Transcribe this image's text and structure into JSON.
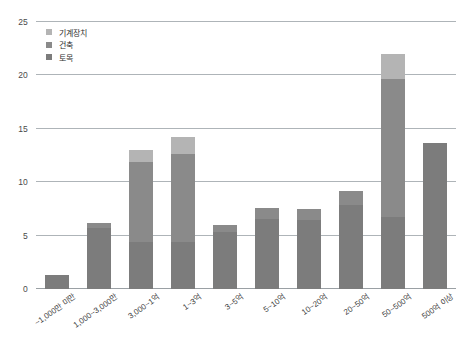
{
  "chart_data": {
    "type": "bar",
    "subtype": "stacked-bar",
    "title": "",
    "xlabel": "",
    "ylabel": "",
    "ylim": [
      0,
      25
    ],
    "yticks": [
      0,
      5,
      10,
      15,
      20,
      25
    ],
    "ytick_labels": [
      "0",
      "5",
      "10",
      "15",
      "20",
      "25"
    ],
    "grid": true,
    "grid_axis": "y",
    "legend_position": "top-left",
    "categories": [
      "~1,000만 미만",
      "1,000~3,000만",
      "3,000~1억",
      "1~3억",
      "3~5억",
      "5~10억",
      "10~20억",
      "20~50억",
      "50~500억",
      "500억 이상"
    ],
    "series": [
      {
        "name": "토목",
        "color": "#7c7c7c",
        "values": [
          1.3,
          5.7,
          4.4,
          4.4,
          5.3,
          6.6,
          6.5,
          7.9,
          6.7,
          13.7
        ]
      },
      {
        "name": "건축",
        "color": "#8a8a8a",
        "values": [
          0,
          0.5,
          7.5,
          8.2,
          0.7,
          1.0,
          1.0,
          1.3,
          13.0,
          0
        ]
      },
      {
        "name": "기계장치",
        "color": "#b4b4b4",
        "values": [
          0,
          0,
          1.1,
          1.6,
          0,
          0,
          0,
          0,
          2.3,
          0
        ]
      }
    ],
    "totals": [
      1.3,
      6.2,
      13.0,
      14.2,
      6.0,
      7.6,
      7.5,
      9.2,
      22.0,
      13.7
    ]
  },
  "style": {
    "background": "#ffffff",
    "grid_color": "#aeb4b8",
    "axis_text_color": "#3c3c3c"
  }
}
